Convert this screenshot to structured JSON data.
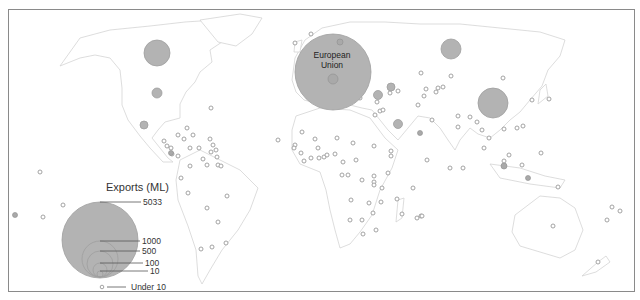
{
  "map": {
    "title": "Exports (ML)",
    "region_labels": {
      "eu_line1": "European",
      "eu_line2": "Union"
    },
    "colors": {
      "bubble_fill": "#b3b3b3",
      "bubble_stroke": "#9e9e9e",
      "land_stroke": "#d4d4d4",
      "frame": "#8a8a8a"
    }
  },
  "legend": {
    "title": "Exports (ML)",
    "items": [
      {
        "label": "5033"
      },
      {
        "label": "1000"
      },
      {
        "label": "500"
      },
      {
        "label": "100"
      },
      {
        "label": "10"
      },
      {
        "label": "Under 10"
      }
    ]
  },
  "bubbles": [
    {
      "region": "European Union",
      "cx": 333,
      "cy": 72,
      "r": 38
    },
    {
      "region": "Canada",
      "cx": 157,
      "cy": 53,
      "r": 13
    },
    {
      "region": "China",
      "cx": 493,
      "cy": 103,
      "r": 15
    },
    {
      "region": "Russia",
      "cx": 451,
      "cy": 49,
      "r": 10
    },
    {
      "region": "United States",
      "cx": 157,
      "cy": 93,
      "r": 5
    },
    {
      "region": "Mexico",
      "cx": 144,
      "cy": 125,
      "r": 4
    },
    {
      "region": "Saudi Arabia",
      "cx": 398,
      "cy": 124,
      "r": 4
    },
    {
      "region": "Iran",
      "cx": 391,
      "cy": 87,
      "r": 4
    },
    {
      "region": "Turkey",
      "cx": 378,
      "cy": 95,
      "r": 4
    },
    {
      "region": "Kazakhstan",
      "cx": 356,
      "cy": 62,
      "r": 3
    }
  ]
}
